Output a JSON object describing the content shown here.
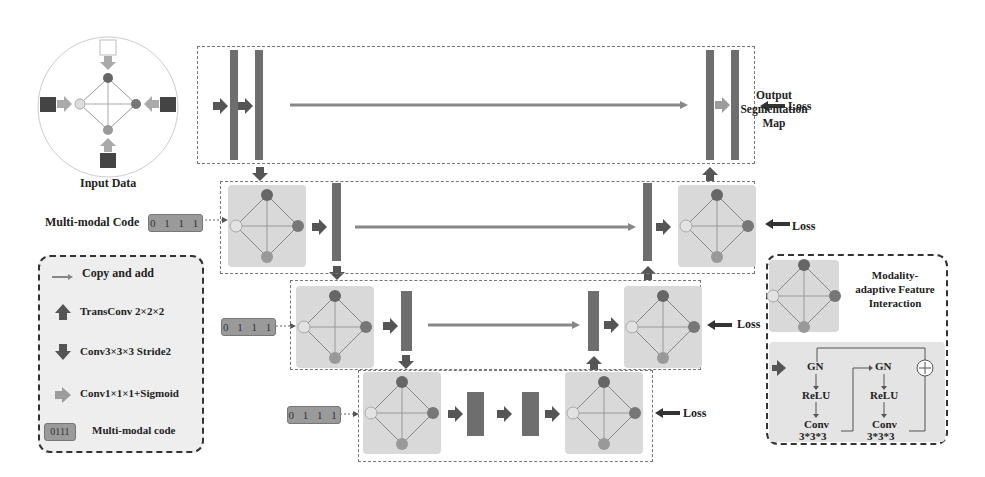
{
  "input": {
    "label": "Input Data"
  },
  "output": {
    "label_line1": "Output",
    "label_line2": "Segmentation",
    "label_line3": "Map"
  },
  "loss_labels": [
    "Loss",
    "Loss",
    "Loss",
    "Loss"
  ],
  "multimodal": {
    "label": "Multi-modal Code",
    "codes": [
      "0 1 1 1",
      "0 1 1 1",
      "0 1 1 1"
    ]
  },
  "legend": {
    "items": [
      {
        "icon": "copy-add-arrow",
        "label": "Copy and add"
      },
      {
        "icon": "up-arrow",
        "label": "TransConv 2×2×2"
      },
      {
        "icon": "down-arrow",
        "label": "Conv3×3×3 Stride2"
      },
      {
        "icon": "right-arrow",
        "label": "Conv1×1×1+Sigmoid"
      },
      {
        "icon": "code-chip",
        "chip": "0111",
        "label": "Multi-modal code"
      }
    ]
  },
  "mafi_legend": {
    "title_line1": "Modality-",
    "title_line2": "adaptive Feature",
    "title_line3": "Interaction",
    "block1": {
      "gn": "GN",
      "relu": "ReLU",
      "conv": "Conv",
      "kernel": "3*3*3"
    },
    "block2": {
      "gn": "GN",
      "relu": "ReLU",
      "conv": "Conv",
      "kernel": "3*3*3"
    }
  },
  "colors": {
    "bar": "#6e6e6e",
    "node_dark": "#666666",
    "node_mid": "#909090",
    "node_light": "#e0e0e0",
    "mafi_bg": "#d9d9d9",
    "arrow_dark": "#555555",
    "arrow_light": "#9a9a9a"
  }
}
